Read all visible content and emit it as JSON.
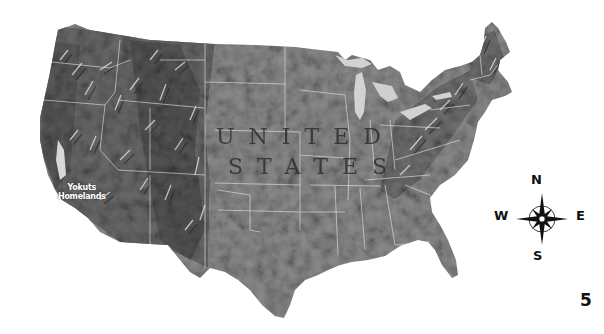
{
  "map": {
    "country_label_line1": "UNITED",
    "country_label_line2": "STATES",
    "region_label_line1": "Yokuts",
    "region_label_line2": "Homelands",
    "style": "shaded relief, grayscale",
    "colors": {
      "land": "#8a8a8a",
      "land_dark": "#4a4a4a",
      "mountains": "#5c5c5c",
      "state_lines": "#e6e6e6",
      "water": "#cfcfcf",
      "background": "#ffffff"
    }
  },
  "compass": {
    "north": "N",
    "south": "S",
    "east": "E",
    "west": "W"
  },
  "page_number": "5"
}
